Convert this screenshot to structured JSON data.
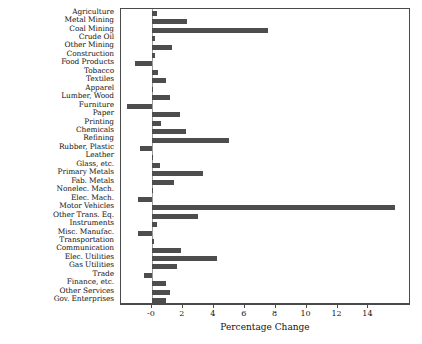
{
  "chart_data": {
    "type": "bar",
    "orientation": "horizontal",
    "title": "",
    "xlabel": "Percentage Change",
    "ylabel": "",
    "xlim": [
      -2.0,
      16.75
    ],
    "xticks": [
      0,
      2,
      4,
      6,
      8,
      10,
      12,
      14
    ],
    "xtick_labels": [
      "-0",
      "2",
      "4",
      "6",
      "8",
      "10",
      "12",
      "14"
    ],
    "grid": false,
    "legend": null,
    "bar_color": "#4d4d4d",
    "zero_line_color": "#9a9a9a",
    "categories": [
      "Agriculture",
      "Metal Mining",
      "Coal Mining",
      "Crude Oil",
      "Other Mining",
      "Construction",
      "Food Products",
      "Tobacco",
      "Textiles",
      "Apparel",
      "Lumber, Wood",
      "Furniture",
      "Paper",
      "Printing",
      "Chemicals",
      "Refining",
      "Rubber, Plastic",
      "Leather",
      "Glass, etc.",
      "Primary Metals",
      "Fab. Metals",
      "Nonelec. Mach.",
      "Elec. Mach.",
      "Motor Vehicles",
      "Other Trans. Eq.",
      "Instruments",
      "Misc. Manufac.",
      "Transportation",
      "Communication",
      "Elec. Utilities",
      "Gas Utilities",
      "Trade",
      "Finance, etc.",
      "Other Services",
      "Gov. Enterprises"
    ],
    "values": [
      0.3,
      2.3,
      7.5,
      0.2,
      1.3,
      0.2,
      -1.1,
      0.4,
      0.9,
      0.05,
      1.2,
      -1.6,
      1.8,
      0.6,
      2.2,
      5.0,
      -0.8,
      0.1,
      0.5,
      3.3,
      1.4,
      0.1,
      -0.9,
      15.7,
      3.0,
      0.3,
      -0.9,
      0.15,
      1.9,
      4.2,
      1.6,
      -0.5,
      0.9,
      1.2,
      0.9
    ]
  }
}
